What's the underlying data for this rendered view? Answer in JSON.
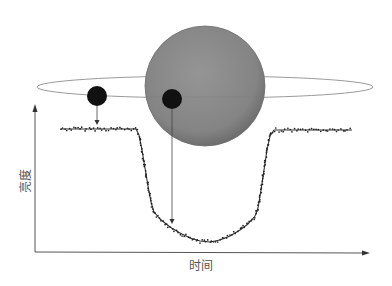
{
  "diagram": {
    "title": "",
    "axes": {
      "x_label": "时间",
      "y_label": "亮度",
      "color": "#555555"
    },
    "star": {
      "name": "star",
      "color": "#8a8a8a",
      "edge_color": "#6e6e6e",
      "cx": 205,
      "cy": 86,
      "r": 60
    },
    "orbit": {
      "cx": 205,
      "cy": 87,
      "rx": 168,
      "ry": 11,
      "color": "#9a9a9a"
    },
    "planets": [
      {
        "name": "planet-outside-transit",
        "cx": 97,
        "cy": 96,
        "r": 10,
        "color": "#111111",
        "arrow_to_y": 125
      },
      {
        "name": "planet-in-transit",
        "cx": 172,
        "cy": 99,
        "r": 10,
        "color": "#111111",
        "arrow_to_y": 224
      }
    ],
    "light_curve": {
      "color": "#333333",
      "points": [
        [
          61,
          129
        ],
        [
          80,
          129
        ],
        [
          100,
          129
        ],
        [
          120,
          129
        ],
        [
          136,
          129
        ],
        [
          139,
          135
        ],
        [
          142,
          150
        ],
        [
          145,
          168
        ],
        [
          148,
          186
        ],
        [
          151,
          202
        ],
        [
          154,
          212
        ],
        [
          160,
          219
        ],
        [
          170,
          227
        ],
        [
          180,
          233
        ],
        [
          190,
          238
        ],
        [
          200,
          241
        ],
        [
          210,
          242
        ],
        [
          220,
          240
        ],
        [
          230,
          236
        ],
        [
          240,
          230
        ],
        [
          248,
          224
        ],
        [
          255,
          216
        ],
        [
          258,
          208
        ],
        [
          261,
          190
        ],
        [
          264,
          170
        ],
        [
          267,
          150
        ],
        [
          270,
          136
        ],
        [
          274,
          130
        ],
        [
          290,
          130
        ],
        [
          310,
          130
        ],
        [
          330,
          130
        ],
        [
          352,
          130
        ]
      ]
    }
  },
  "chart_data": {
    "type": "line",
    "title": "",
    "xlabel": "时间",
    "ylabel": "亮度",
    "grid": false,
    "legend": null,
    "x": [
      0,
      10,
      20,
      30,
      38,
      40,
      42,
      44,
      46,
      48,
      50,
      55,
      60,
      65,
      70,
      75,
      80,
      85,
      90,
      95,
      100,
      102,
      104,
      106,
      108,
      110,
      115,
      125,
      135,
      150
    ],
    "series": [
      {
        "name": "亮度",
        "values": [
          1.0,
          1.0,
          1.0,
          1.0,
          1.0,
          0.94,
          0.8,
          0.66,
          0.53,
          0.42,
          0.31,
          0.22,
          0.16,
          0.12,
          0.1,
          0.09,
          0.1,
          0.14,
          0.2,
          0.28,
          0.4,
          0.55,
          0.7,
          0.84,
          0.96,
          1.0,
          1.0,
          1.0,
          1.0,
          1.0
        ]
      }
    ],
    "ylim": [
      0,
      1.1
    ]
  }
}
